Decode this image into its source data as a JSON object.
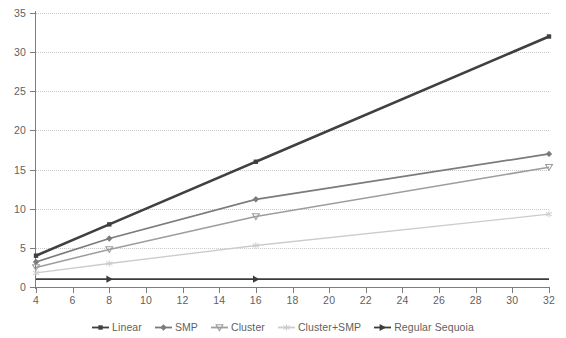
{
  "chart_data": {
    "type": "line",
    "title": "",
    "subtitle": "",
    "xlabel": "",
    "ylabel": "",
    "xlim": [
      4,
      32
    ],
    "ylim": [
      0,
      35
    ],
    "x": [
      4,
      8,
      16,
      32
    ],
    "x_ticks": [
      4,
      6,
      8,
      10,
      12,
      14,
      16,
      18,
      20,
      22,
      24,
      26,
      28,
      30,
      32
    ],
    "y_ticks": [
      0,
      5,
      10,
      15,
      20,
      25,
      30,
      35
    ],
    "grid": "horizontal-dotted",
    "legend_position": "bottom-center",
    "series": [
      {
        "name": "Linear",
        "values": [
          4,
          8,
          16,
          32
        ],
        "color": "#404040",
        "marker": "square",
        "width": 2.6
      },
      {
        "name": "SMP",
        "values": [
          3.2,
          6.2,
          11.2,
          17.0
        ],
        "color": "#7b7b7b",
        "marker": "diamond",
        "width": 1.7
      },
      {
        "name": "Cluster",
        "values": [
          2.5,
          4.8,
          9.0,
          15.3
        ],
        "color": "#9d9d9d",
        "marker": "triangle-down",
        "width": 1.5
      },
      {
        "name": "Cluster+SMP",
        "values": [
          1.8,
          3.0,
          5.3,
          9.3
        ],
        "color": "#cccccc",
        "marker": "asterisk",
        "width": 1.3
      },
      {
        "name": "Regular Sequoia",
        "values": [
          1.0,
          1.0,
          1.0,
          1.0
        ],
        "color": "#3c3c3c",
        "marker": "triangle-right",
        "width": 1.9
      }
    ]
  },
  "axes": {
    "y_labels": [
      "0",
      "5",
      "10",
      "15",
      "20",
      "25",
      "30",
      "35"
    ],
    "x_labels": [
      "4",
      "6",
      "8",
      "10",
      "12",
      "14",
      "16",
      "18",
      "20",
      "22",
      "24",
      "26",
      "28",
      "30",
      "32"
    ]
  },
  "legend": {
    "items": [
      {
        "label": "Linear",
        "marker": "square",
        "color": "#404040"
      },
      {
        "label": "SMP",
        "marker": "diamond",
        "color": "#7b7b7b"
      },
      {
        "label": "Cluster",
        "marker": "triangle-down",
        "color": "#9d9d9d"
      },
      {
        "label": "Cluster+SMP",
        "marker": "asterisk",
        "color": "#cccccc"
      },
      {
        "label": "Regular Sequoia",
        "marker": "triangle-right",
        "color": "#3c3c3c"
      }
    ]
  },
  "colors": {
    "background": "#ffffff",
    "axis": "#7d7d7d",
    "gridline": "#c9c9c9",
    "text": "#5f5f5f"
  }
}
